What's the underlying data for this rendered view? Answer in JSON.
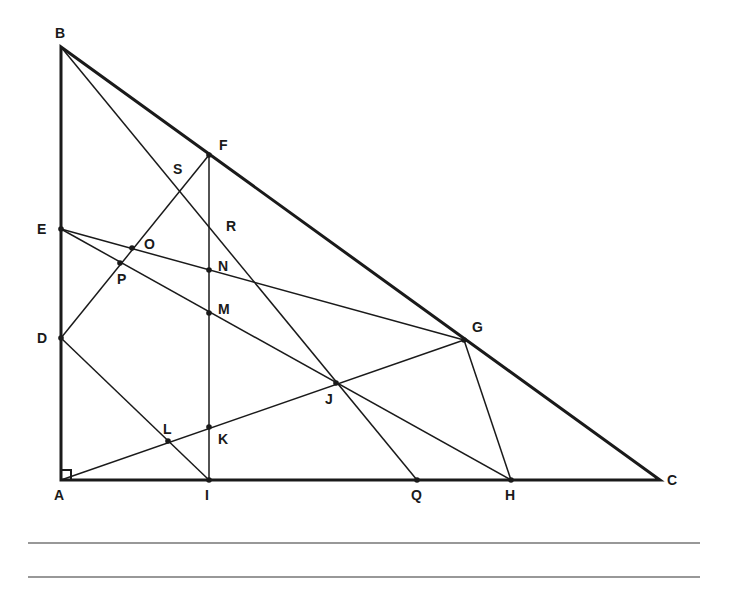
{
  "figure": {
    "type": "geometry-diagram",
    "right_angle_at": "A",
    "colors": {
      "stroke": "#1a1a1a",
      "background": "#ffffff",
      "rule": "#333333"
    },
    "points": {
      "A": {
        "label": "A",
        "x": 61,
        "y": 480,
        "lx": 54,
        "ly": 500,
        "dot": false
      },
      "B": {
        "label": "B",
        "x": 61,
        "y": 47,
        "lx": 55,
        "ly": 38,
        "dot": false
      },
      "C": {
        "label": "C",
        "x": 660,
        "y": 480,
        "lx": 667,
        "ly": 485,
        "dot": false
      },
      "D": {
        "label": "D",
        "x": 61,
        "y": 338,
        "lx": 37,
        "ly": 343,
        "dot": true
      },
      "E": {
        "label": "E",
        "x": 61,
        "y": 229,
        "lx": 37,
        "ly": 234,
        "dot": true
      },
      "F": {
        "label": "F",
        "x": 209,
        "y": 155,
        "lx": 219,
        "ly": 150,
        "dot": true
      },
      "G": {
        "label": "G",
        "x": 464,
        "y": 340,
        "lx": 472,
        "ly": 332,
        "dot": true
      },
      "H": {
        "label": "H",
        "x": 511,
        "y": 480,
        "lx": 505,
        "ly": 500,
        "dot": true
      },
      "I": {
        "label": "I",
        "x": 209,
        "y": 480,
        "lx": 205,
        "ly": 500,
        "dot": true
      },
      "J": {
        "label": "J",
        "x": 336,
        "y": 383,
        "lx": 325,
        "ly": 404,
        "dot": true
      },
      "K": {
        "label": "K",
        "x": 209,
        "y": 427,
        "lx": 218,
        "ly": 444,
        "dot": true
      },
      "L": {
        "label": "L",
        "x": 168,
        "y": 441,
        "lx": 163,
        "ly": 434,
        "dot": true
      },
      "M": {
        "label": "M",
        "x": 209,
        "y": 313,
        "lx": 218,
        "ly": 314,
        "dot": true
      },
      "N": {
        "label": "N",
        "x": 209,
        "y": 270,
        "lx": 218,
        "ly": 271,
        "dot": true
      },
      "O": {
        "label": "O",
        "x": 132,
        "y": 248,
        "lx": 144,
        "ly": 249,
        "dot": true
      },
      "P": {
        "label": "P",
        "x": 120,
        "y": 263,
        "lx": 117,
        "ly": 284,
        "dot": true
      },
      "Q": {
        "label": "Q",
        "x": 417,
        "y": 480,
        "lx": 411,
        "ly": 500,
        "dot": true
      },
      "R": {
        "label": "R",
        "x": 209,
        "y": 230,
        "lx": 226,
        "ly": 231,
        "dot": false
      },
      "S": {
        "label": "S",
        "x": 178,
        "y": 193,
        "lx": 173,
        "ly": 174,
        "dot": false
      }
    },
    "triangle": [
      "A",
      "B",
      "C"
    ],
    "segments": [
      [
        "B",
        "Q"
      ],
      [
        "F",
        "I"
      ],
      [
        "F",
        "D"
      ],
      [
        "E",
        "G"
      ],
      [
        "E",
        "H"
      ],
      [
        "A",
        "G"
      ],
      [
        "D",
        "I"
      ],
      [
        "G",
        "H"
      ]
    ],
    "answer_lines": [
      {
        "x1": 28,
        "y1": 543,
        "x2": 700,
        "y2": 543
      },
      {
        "x1": 28,
        "y1": 577,
        "x2": 700,
        "y2": 577
      }
    ]
  }
}
